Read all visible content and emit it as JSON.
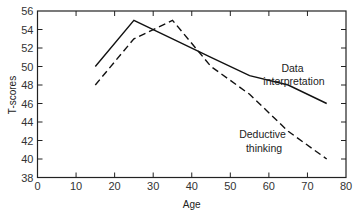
{
  "chart_data": {
    "type": "line",
    "title": "",
    "xlabel": "Age",
    "ylabel": "T-scores",
    "xlim": [
      0,
      80
    ],
    "ylim": [
      38,
      56
    ],
    "xticks": [
      0,
      10,
      20,
      30,
      40,
      50,
      60,
      70,
      80
    ],
    "yticks": [
      38,
      40,
      42,
      44,
      46,
      48,
      50,
      52,
      54,
      56
    ],
    "grid": false,
    "legend": "inline annotations",
    "x": [
      15,
      25,
      35,
      45,
      55,
      65,
      75
    ],
    "series": [
      {
        "name": "Data interpretation",
        "style": "solid",
        "values": [
          50,
          55,
          53,
          51,
          49,
          48,
          46
        ]
      },
      {
        "name": "Deductive thinking",
        "style": "dashed",
        "values": [
          48,
          53,
          55,
          50,
          47,
          43,
          40
        ]
      }
    ],
    "annotations": [
      {
        "lines": [
          "Data",
          "interpretation"
        ],
        "series": "Data interpretation"
      },
      {
        "lines": [
          "Deductive",
          "thinking"
        ],
        "series": "Deductive thinking"
      }
    ]
  },
  "colors": {
    "line": "#111111",
    "axis": "#222222",
    "background": "#ffffff"
  }
}
